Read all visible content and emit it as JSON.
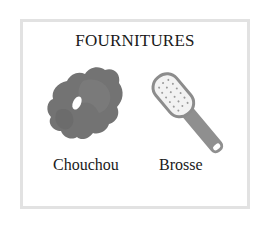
{
  "card": {
    "title": "FOURNITURES",
    "items": [
      {
        "label": "Chouchou",
        "icon": "scrunchie-icon",
        "color": "#6f6f6f"
      },
      {
        "label": "Brosse",
        "icon": "hairbrush-icon",
        "color": "#8a8a8a"
      }
    ],
    "border_color": "#e2e2e2"
  }
}
